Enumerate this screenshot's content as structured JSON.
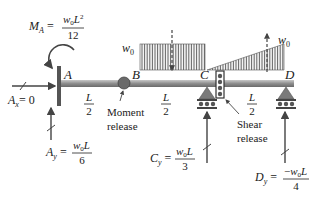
{
  "diagram": {
    "points": [
      "A",
      "B",
      "C",
      "D"
    ],
    "segment_labels": {
      "AB": {
        "num": "L",
        "den": "2"
      },
      "BC": {
        "num": "L",
        "den": "2"
      },
      "CD": {
        "num": "L",
        "den": "2"
      }
    },
    "loads": {
      "uniform_label": "w",
      "uniform_sub": "0",
      "triangular_label": "w",
      "triangular_sub": "0"
    },
    "reactions": {
      "MA": {
        "lhs_main": "M",
        "lhs_sub": "A",
        "num_main": "w",
        "num_sub": "0",
        "num_tail": "L",
        "num_sup": "2",
        "den": "12"
      },
      "Ax": {
        "lhs_main": "A",
        "lhs_sub": "x",
        "rhs": "= 0"
      },
      "Ay": {
        "lhs_main": "A",
        "lhs_sub": "y",
        "num_main": "w",
        "num_sub": "0",
        "num_tail": "L",
        "den": "6"
      },
      "Cy": {
        "lhs_main": "C",
        "lhs_sub": "y",
        "num_main": "w",
        "num_sub": "0",
        "num_tail": "L",
        "den": "3"
      },
      "Dy": {
        "lhs_main": "D",
        "lhs_sub": "y",
        "num_pre": "−",
        "num_main": "w",
        "num_sub": "0",
        "num_tail": "L",
        "den": "4"
      }
    },
    "annotations": {
      "moment_release": [
        "Moment",
        "release"
      ],
      "shear_release": [
        "Shear",
        "release"
      ]
    },
    "colors": {
      "beam": "#8a8a8a",
      "load_hatch": "#555555",
      "support": "#7a7a7a",
      "text": "#222222"
    }
  }
}
